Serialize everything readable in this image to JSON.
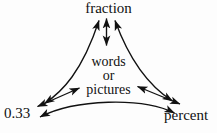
{
  "diagram": {
    "type": "concept-map",
    "title": "",
    "background_color": "#fdfdfd",
    "stroke_color": "#111111",
    "nodes": {
      "fraction": {
        "label": "fraction",
        "position": "top"
      },
      "center": {
        "line1": "words",
        "line2": "or",
        "line3": "pictures",
        "position": "center"
      },
      "decimal": {
        "label": "0.33",
        "position": "bottom-left"
      },
      "percent": {
        "label": "percent",
        "position": "bottom-right"
      }
    },
    "connections": [
      {
        "name": "center-to-fraction",
        "from": "center",
        "to": "fraction",
        "style": "straight",
        "arrowheads": "both"
      },
      {
        "name": "decimal-to-fraction",
        "from": "decimal",
        "to": "fraction",
        "style": "curved",
        "arrowheads": "both"
      },
      {
        "name": "percent-to-fraction",
        "from": "percent",
        "to": "fraction",
        "style": "curved",
        "arrowheads": "both"
      },
      {
        "name": "decimal-to-center",
        "from": "decimal",
        "to": "center",
        "style": "straight",
        "arrowheads": "both"
      },
      {
        "name": "percent-to-center",
        "from": "percent",
        "to": "center",
        "style": "straight",
        "arrowheads": "both"
      },
      {
        "name": "decimal-to-percent",
        "from": "decimal",
        "to": "percent",
        "style": "curved",
        "arrowheads": "both"
      }
    ]
  }
}
